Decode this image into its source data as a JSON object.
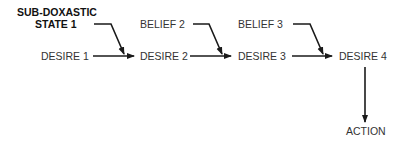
{
  "diagram": {
    "nodes": {
      "sub_doxastic_line1": "SUB-DOXASTIC",
      "sub_doxastic_line2": "STATE 1",
      "desire1": "DESIRE 1",
      "belief2": "BELIEF 2",
      "desire2": "DESIRE 2",
      "belief3": "BELIEF 3",
      "desire3": "DESIRE 3",
      "desire4": "DESIRE 4",
      "action": "ACTION"
    },
    "edges": [
      {
        "from": "SUB-DOXASTIC STATE 1",
        "to": "DESIRE 2 (joins arrow)"
      },
      {
        "from": "DESIRE 1",
        "to": "DESIRE 2"
      },
      {
        "from": "BELIEF 2",
        "to": "DESIRE 3 (joins arrow)"
      },
      {
        "from": "DESIRE 2",
        "to": "DESIRE 3"
      },
      {
        "from": "BELIEF 3",
        "to": "DESIRE 4 (joins arrow)"
      },
      {
        "from": "DESIRE 3",
        "to": "DESIRE 4"
      },
      {
        "from": "DESIRE 4",
        "to": "ACTION"
      }
    ],
    "colors": {
      "line": "#1a1a1a",
      "text": "#333333"
    }
  }
}
